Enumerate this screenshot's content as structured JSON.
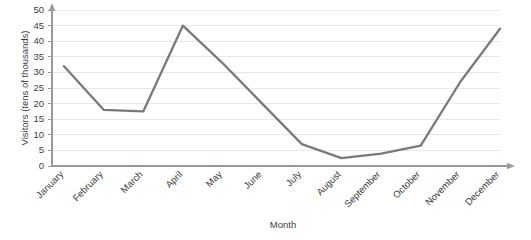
{
  "chart_data": {
    "type": "line",
    "title": "",
    "xlabel": "Month",
    "ylabel": "Visitors (tens of thousands)",
    "categories": [
      "January",
      "February",
      "March",
      "April",
      "May",
      "June",
      "July",
      "August",
      "September",
      "October",
      "November",
      "December"
    ],
    "values": [
      32,
      18,
      17.5,
      45,
      33,
      20,
      7,
      2.5,
      4,
      6.5,
      27,
      44
    ],
    "series": [
      {
        "name": "Visitors",
        "values": [
          32,
          18,
          17.5,
          45,
          33,
          20,
          7,
          2.5,
          4,
          6.5,
          27,
          44
        ],
        "color": "#7a7a7a"
      }
    ],
    "ylim": [
      0,
      50
    ],
    "yticks": [
      0,
      5,
      10,
      15,
      20,
      25,
      30,
      35,
      40,
      45,
      50
    ],
    "ytick_labels": [
      "0",
      "5",
      "10",
      "15",
      "20",
      "25",
      "30",
      "35",
      "40",
      "45",
      "50"
    ],
    "grid": true,
    "grid_axis": "y",
    "legend": false,
    "legend_position": "none",
    "xtick_rotation": 45,
    "line_color": "#7a7a7a",
    "grid_color": "#e8e8e8",
    "axis_color": "#9a9a9a",
    "markers": false
  }
}
